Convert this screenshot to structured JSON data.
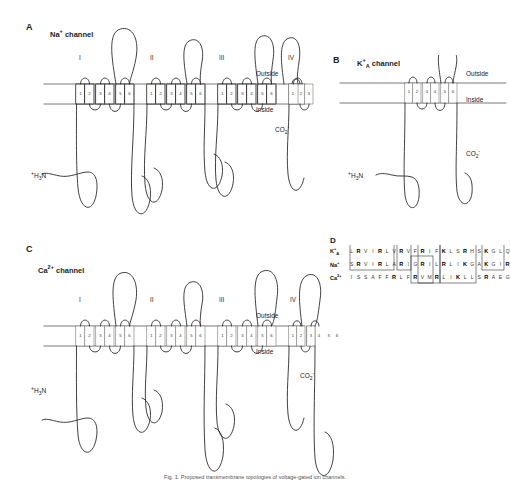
{
  "figure": {
    "caption": "Fig. 1. Proposed transmembrane topologies of voltage-gated ion channels."
  },
  "membrane_labels": {
    "outside": "Outside",
    "inside": "Inside"
  },
  "termini": {
    "n_term": "H3N",
    "n_term_charge": "+",
    "c_term": "CO2",
    "c_term_charge": "-"
  },
  "panels": [
    {
      "id": "A",
      "letter": "A",
      "title_base": "Na",
      "title_sup": "+",
      "title_sub": "",
      "title_suffix": "channel",
      "domains": [
        "I",
        "II",
        "III",
        "IV"
      ],
      "segments": [
        "1",
        "2",
        "3",
        "4",
        "5",
        "6"
      ],
      "n_terminus": "intracellular",
      "c_terminus": "intracellular"
    },
    {
      "id": "B",
      "letter": "B",
      "title_base": "K",
      "title_sup": "+",
      "title_sub": "A",
      "title_suffix": "channel",
      "domains": [],
      "segments": [
        "1",
        "2",
        "3",
        "4",
        "5",
        "6"
      ],
      "n_terminus": "intracellular",
      "c_terminus": "intracellular"
    },
    {
      "id": "C",
      "letter": "C",
      "title_base": "Ca",
      "title_sup": "2+",
      "title_sub": "",
      "title_suffix": "channel",
      "domains": [
        "I",
        "II",
        "III",
        "IV"
      ],
      "segments": [
        "1",
        "2",
        "3",
        "4",
        "5",
        "6"
      ],
      "n_terminus": "intracellular",
      "c_terminus": "intracellular"
    }
  ],
  "panelD": {
    "letter": "D",
    "rows": [
      {
        "label_base": "K",
        "label_sup": "+",
        "label_sub": "A",
        "residues": [
          "L",
          "R",
          "V",
          "I",
          "R",
          "L",
          "V",
          "R",
          "V",
          "F",
          "R",
          "I",
          "F",
          "K",
          "L",
          "S",
          "R",
          "H",
          "S",
          "K",
          "G",
          "L",
          "Q"
        ],
        "basic_positions": [
          1,
          4,
          7,
          10,
          13,
          16,
          19
        ]
      },
      {
        "label_base": "Na",
        "label_sup": "+",
        "label_sub": "",
        "residues": [
          "S",
          "R",
          "V",
          "I",
          "R",
          "L",
          "A",
          "R",
          "I",
          "G",
          "R",
          "I",
          "L",
          "R",
          "L",
          "I",
          "K",
          "G",
          "A",
          "K",
          "G",
          "I",
          "R"
        ],
        "basic_positions": [
          1,
          4,
          7,
          10,
          13,
          16,
          19,
          22
        ]
      },
      {
        "label_base": "Ca",
        "label_sup": "2+",
        "label_sub": "",
        "residues": [
          "I",
          "S",
          "S",
          "A",
          "F",
          "F",
          "R",
          "L",
          "F",
          "R",
          "V",
          "M",
          "R",
          "L",
          "I",
          "K",
          "L",
          "L",
          "S",
          "R",
          "A",
          "E",
          "G"
        ],
        "basic_positions": [
          6,
          9,
          12,
          15,
          19
        ]
      }
    ],
    "boxes": [
      {
        "x": 2,
        "y": -1,
        "w": 44,
        "h": 26
      },
      {
        "x": 49,
        "y": -1,
        "w": 14,
        "h": 26
      },
      {
        "x": 63,
        "y": 11,
        "w": 22,
        "h": 27
      },
      {
        "x": 70,
        "y": -1,
        "w": 22,
        "h": 39
      },
      {
        "x": 92,
        "y": -1,
        "w": 36,
        "h": 39
      },
      {
        "x": 134,
        "y": -1,
        "w": 22,
        "h": 26
      }
    ]
  }
}
